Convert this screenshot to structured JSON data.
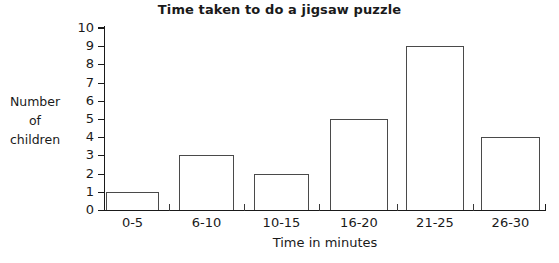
{
  "chart_data": {
    "type": "bar",
    "title": "Time taken to do a jigsaw puzzle",
    "xlabel": "Time in minutes",
    "ylabel": "Number of children",
    "ylabel_lines": [
      "Number",
      "of",
      "children"
    ],
    "categories": [
      "0-5",
      "6-10",
      "10-15",
      "16-20",
      "21-25",
      "26-30"
    ],
    "values": [
      1,
      3,
      2,
      5,
      9,
      4
    ],
    "ylim": [
      0,
      10
    ],
    "ytick_labels": [
      "0",
      "1",
      "2",
      "3",
      "4",
      "5",
      "6",
      "7",
      "8",
      "9",
      "10"
    ],
    "ytick_values": [
      0,
      1,
      2,
      3,
      4,
      5,
      6,
      7,
      8,
      9,
      10
    ],
    "grid": false,
    "legend": false,
    "bar_fill": "#ffffff",
    "bar_edge": "#4a4a4a",
    "axis_color": "#1a1a1a",
    "background": "#ffffff"
  }
}
